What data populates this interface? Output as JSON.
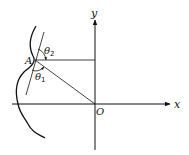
{
  "diagram": {
    "axes": {
      "x_label": "x",
      "y_label": "y",
      "origin_label": "O"
    },
    "point": {
      "label": "A"
    },
    "angles": {
      "theta1": {
        "symbol": "θ",
        "subscript": "1"
      },
      "theta2": {
        "symbol": "θ",
        "subscript": "2"
      }
    },
    "colors": {
      "stroke": "#111111",
      "background": "#ffffff"
    }
  }
}
